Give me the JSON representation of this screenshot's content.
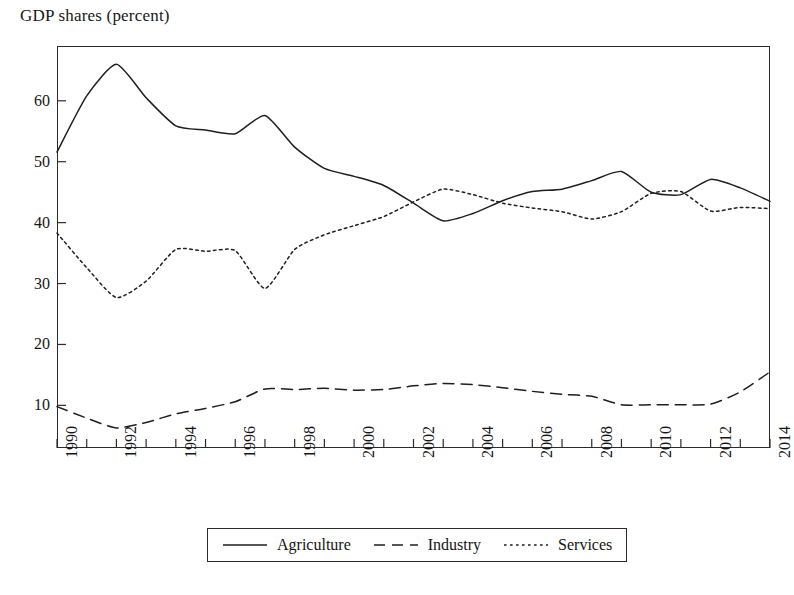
{
  "chart_data": {
    "type": "line",
    "title": "GDP shares (percent)",
    "xlabel": "",
    "ylabel": "",
    "x": [
      1990,
      1991,
      1992,
      1993,
      1994,
      1995,
      1996,
      1997,
      1998,
      1999,
      2000,
      2001,
      2002,
      2003,
      2004,
      2005,
      2006,
      2007,
      2008,
      2009,
      2010,
      2011,
      2012,
      2013,
      2014
    ],
    "xlim": [
      1990,
      2014
    ],
    "ylim": [
      3.0,
      69.0
    ],
    "xticks": [
      1990,
      1992,
      1994,
      1996,
      1998,
      2000,
      2002,
      2004,
      2006,
      2008,
      2010,
      2012,
      2014
    ],
    "xtick_labels": [
      "1990",
      "1992",
      "1994",
      "1996",
      "1998",
      "2000",
      "2002",
      "2004",
      "2006",
      "2008",
      "2010",
      "2012",
      "2014"
    ],
    "xtick_minor": [
      1991,
      1993,
      1995,
      1997,
      1999,
      2001,
      2003,
      2005,
      2007,
      2009,
      2011,
      2013
    ],
    "yticks": [
      10,
      20,
      30,
      40,
      50,
      60
    ],
    "ytick_labels": [
      "10",
      "20",
      "30",
      "40",
      "50",
      "60"
    ],
    "grid": false,
    "legend_position": "bottom-center",
    "series": [
      {
        "name": "Agriculture",
        "style": "solid",
        "color": "#1f1f1f",
        "values": [
          51.6,
          60.8,
          66.0,
          60.5,
          55.9,
          55.2,
          54.6,
          57.6,
          52.4,
          48.9,
          47.6,
          46.1,
          43.2,
          40.3,
          41.5,
          43.6,
          45.1,
          45.5,
          46.9,
          48.4,
          45.0,
          44.6,
          47.1,
          45.7,
          43.5
        ]
      },
      {
        "name": "Industry",
        "style": "dashed",
        "color": "#1f1f1f",
        "values": [
          9.8,
          7.9,
          6.3,
          7.2,
          8.6,
          9.5,
          10.6,
          12.7,
          12.6,
          12.8,
          12.5,
          12.6,
          13.2,
          13.6,
          13.4,
          12.9,
          12.3,
          11.8,
          11.5,
          10.1,
          10.1,
          10.1,
          10.2,
          12.2,
          15.5
        ]
      },
      {
        "name": "Services",
        "style": "dotted",
        "color": "#1f1f1f",
        "values": [
          38.3,
          32.6,
          27.7,
          30.4,
          35.6,
          35.3,
          35.4,
          29.2,
          35.6,
          38.0,
          39.5,
          41.0,
          43.4,
          45.5,
          44.6,
          43.2,
          42.4,
          41.8,
          40.6,
          41.8,
          44.8,
          45.1,
          41.9,
          42.5,
          42.3
        ]
      }
    ]
  },
  "legend": {
    "entries": [
      {
        "label": "Agriculture",
        "style": "solid"
      },
      {
        "label": "Industry",
        "style": "dashed"
      },
      {
        "label": "Services",
        "style": "dotted"
      }
    ]
  }
}
